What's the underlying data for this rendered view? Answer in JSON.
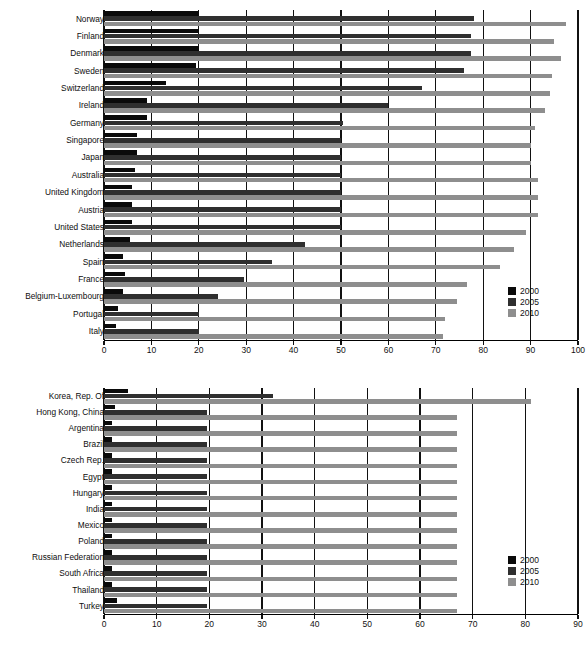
{
  "chart_data": [
    {
      "id": "top",
      "type": "bar",
      "orientation": "horizontal",
      "title": "",
      "xlabel": "",
      "ylabel": "",
      "xlim": [
        0,
        100
      ],
      "xticks": [
        0,
        10,
        20,
        30,
        40,
        50,
        60,
        70,
        80,
        90,
        100
      ],
      "grid": true,
      "legend_position": "bottom-right",
      "legend": [
        "2000",
        "2005",
        "2010"
      ],
      "categories": [
        "Norway",
        "Finland",
        "Denmark",
        "Sweden",
        "Switzerland",
        "Ireland",
        "Germany",
        "Singapore",
        "Japan",
        "Australia",
        "United Kingdom",
        "Austria",
        "United States",
        "Netherlands",
        "Spain",
        "France",
        "Belgium-Luxembourg",
        "Portugal",
        "Italy"
      ],
      "series": [
        {
          "name": "2000",
          "values": [
            20.0,
            20.0,
            20.0,
            19.5,
            13.0,
            9.0,
            9.0,
            7.0,
            7.0,
            6.5,
            6.0,
            6.0,
            6.0,
            5.5,
            4.0,
            4.5,
            4.0,
            3.0,
            2.5
          ]
        },
        {
          "name": "2005",
          "values": [
            78.0,
            77.5,
            77.5,
            76.0,
            67.0,
            60.0,
            50.5,
            50.0,
            50.0,
            50.0,
            50.0,
            50.0,
            50.0,
            42.5,
            35.5,
            29.5,
            24.0,
            20.0,
            20.0
          ]
        },
        {
          "name": "2010",
          "values": [
            97.5,
            95.0,
            96.5,
            94.5,
            94.0,
            93.0,
            91.0,
            90.0,
            90.0,
            91.5,
            91.5,
            91.5,
            89.0,
            86.5,
            83.5,
            76.5,
            74.5,
            72.0,
            71.5
          ]
        }
      ]
    },
    {
      "id": "bottom",
      "type": "bar",
      "orientation": "horizontal",
      "title": "",
      "xlabel": "",
      "ylabel": "",
      "xlim": [
        0,
        90
      ],
      "xticks": [
        0,
        10,
        20,
        30,
        40,
        50,
        60,
        70,
        80,
        90
      ],
      "grid": true,
      "legend_position": "bottom-right",
      "legend": [
        "2000",
        "2005",
        "2010"
      ],
      "categories": [
        "Korea, Rep. Of",
        "Hong Kong, China",
        "Argentina",
        "Brazil",
        "Czech Rep.",
        "Egypt",
        "Hungary",
        "India",
        "Mexico",
        "Poland",
        "Russian Federation",
        "South Africa",
        "Thailand",
        "Turkey"
      ],
      "series": [
        {
          "name": "2000",
          "values": [
            4.5,
            2.0,
            1.5,
            1.5,
            1.5,
            1.5,
            1.5,
            1.5,
            1.5,
            1.5,
            1.5,
            1.5,
            1.5,
            2.5
          ]
        },
        {
          "name": "2005",
          "values": [
            32.0,
            19.5,
            19.5,
            19.5,
            19.5,
            19.5,
            19.5,
            19.5,
            19.5,
            19.5,
            19.5,
            19.5,
            19.5,
            19.5
          ]
        },
        {
          "name": "2010",
          "values": [
            81.0,
            67.0,
            67.0,
            67.0,
            67.0,
            67.0,
            67.0,
            67.0,
            67.0,
            67.0,
            67.0,
            67.0,
            67.0,
            67.0
          ]
        }
      ]
    }
  ],
  "colors": {
    "series_2000": "#0a0a0a",
    "series_2005": "#2f2f2f",
    "series_2010": "#8e8e8e",
    "axis": "#111111",
    "background": "#ffffff"
  }
}
